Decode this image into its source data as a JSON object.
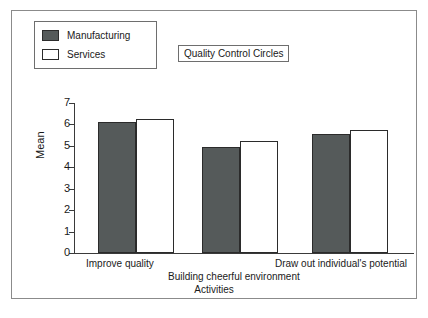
{
  "chart_data": {
    "type": "bar",
    "title": "Quality Control Circles",
    "xlabel": "Activities",
    "ylabel": "Mean",
    "ylim": [
      0,
      7
    ],
    "yticks": [
      "0",
      "1",
      "2",
      "3",
      "4",
      "5",
      "6",
      "7"
    ],
    "grid": false,
    "legend_position": "top-left",
    "categories": [
      "Improve quality",
      "Building cheerful environment",
      "Draw out individual's potential"
    ],
    "series": [
      {
        "name": "Manufacturing",
        "color": "#555a5a",
        "values": [
          6.1,
          4.95,
          5.55
        ]
      },
      {
        "name": "Services",
        "color": "#ffffff",
        "values": [
          6.25,
          5.25,
          5.75
        ]
      }
    ]
  },
  "legend": {
    "items": [
      {
        "label": "Manufacturing",
        "swatch": "manufacturing"
      },
      {
        "label": "Services",
        "swatch": "services"
      }
    ]
  },
  "axis": {
    "y_title": "Mean",
    "x_title": "Activities"
  }
}
